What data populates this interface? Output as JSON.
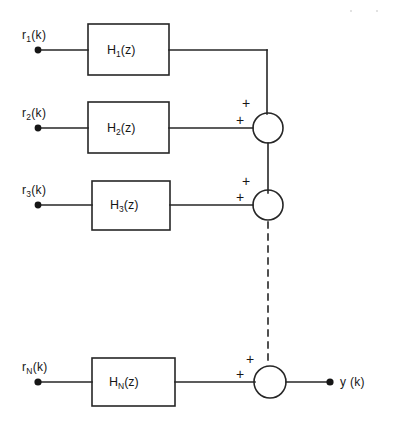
{
  "figure": {
    "type": "block-diagram",
    "output_label": "y (k)",
    "inputs": [
      {
        "name": "r1",
        "label_base": "r",
        "label_sub": "1",
        "label_tail": "(k)"
      },
      {
        "name": "r2",
        "label_base": "r",
        "label_sub": "2",
        "label_tail": "(k)"
      },
      {
        "name": "r3",
        "label_base": "r",
        "label_sub": "3",
        "label_tail": "(k)"
      },
      {
        "name": "rN",
        "label_base": "r",
        "label_sub": "N",
        "label_tail": "(k)"
      }
    ],
    "blocks": [
      {
        "name": "H1",
        "base": "H",
        "sub": "1",
        "tail": "(z)"
      },
      {
        "name": "H2",
        "base": "H",
        "sub": "2",
        "tail": "(z)"
      },
      {
        "name": "H3",
        "base": "H",
        "sub": "3",
        "tail": "(z)"
      },
      {
        "name": "HN",
        "base": "H",
        "sub": "N",
        "tail": "(z)"
      }
    ],
    "summers": [
      {
        "name": "sum-1",
        "signs": [
          "+",
          "+"
        ]
      },
      {
        "name": "sum-2",
        "signs": [
          "+",
          "+"
        ]
      },
      {
        "name": "sum-n",
        "signs": [
          "+",
          "+"
        ]
      }
    ],
    "plus_sign": "+",
    "colors": {
      "line": "#262626",
      "text": "#161616",
      "background": "#ffffff"
    }
  }
}
